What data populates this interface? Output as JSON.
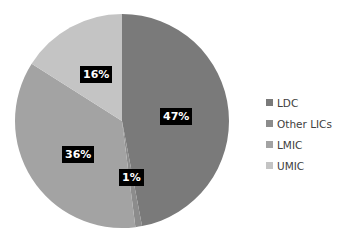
{
  "chart_data": {
    "type": "pie",
    "title": "",
    "categories": [
      "LDC",
      "Other LICs",
      "LMIC",
      "UMIC"
    ],
    "values": [
      47,
      1,
      36,
      16
    ],
    "labels": [
      "47%",
      "1%",
      "36%",
      "16%"
    ],
    "colors": [
      "#7a7a7a",
      "#8c8c8c",
      "#a3a3a3",
      "#c4c4c4"
    ],
    "legend_position": "right"
  },
  "legend": {
    "items": [
      {
        "label": "LDC",
        "color": "#7a7a7a"
      },
      {
        "label": "Other LICs",
        "color": "#8c8c8c"
      },
      {
        "label": "LMIC",
        "color": "#a3a3a3"
      },
      {
        "label": "UMIC",
        "color": "#c4c4c4"
      }
    ]
  }
}
